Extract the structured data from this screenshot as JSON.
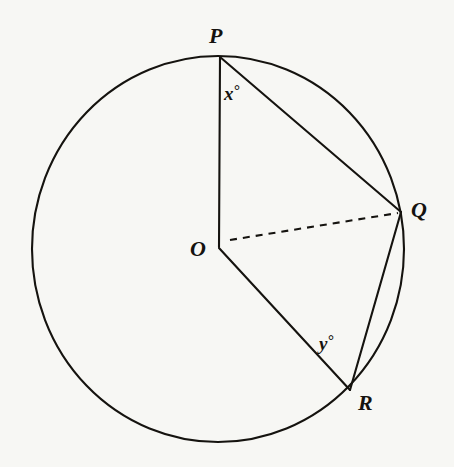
{
  "figure": {
    "kind": "circle-geometry-diagram",
    "background_color": "#f7f7f4",
    "stroke_color": "#15130f",
    "circle": {
      "center_label": "O",
      "center_x": 218,
      "center_y": 249,
      "radius_x": 186,
      "radius_y": 193,
      "stroke_width": 2.0
    },
    "points": [
      {
        "id": "P",
        "label": "P",
        "x": 220,
        "y": 57,
        "on_circle": true
      },
      {
        "id": "Q",
        "label": "Q",
        "x": 401,
        "y": 212,
        "on_circle": true
      },
      {
        "id": "R",
        "label": "R",
        "x": 350,
        "y": 390,
        "on_circle": true
      },
      {
        "id": "O",
        "label": "O",
        "x": 218,
        "y": 246,
        "on_circle": false
      }
    ],
    "segments": [
      {
        "id": "OP",
        "from": "O",
        "to": "P",
        "style": "solid",
        "x1": 218,
        "y1": 246,
        "x2": 220,
        "y2": 57
      },
      {
        "id": "OR",
        "from": "O",
        "to": "R",
        "style": "solid",
        "x1": 218,
        "y1": 246,
        "x2": 350,
        "y2": 390
      },
      {
        "id": "OQ",
        "from": "O",
        "to": "Q",
        "style": "dashed",
        "x1": 228,
        "y1": 240,
        "x2": 399,
        "y2": 213
      },
      {
        "id": "PQ",
        "from": "P",
        "to": "Q",
        "style": "solid",
        "x1": 220,
        "y1": 57,
        "x2": 401,
        "y2": 212
      },
      {
        "id": "QR",
        "from": "Q",
        "to": "R",
        "style": "solid",
        "x1": 401,
        "y1": 212,
        "x2": 350,
        "y2": 390
      }
    ],
    "angle_labels": [
      {
        "id": "x",
        "variable": "x",
        "degree_symbol": "°",
        "at_vertex": "P",
        "x": 237,
        "y": 94
      },
      {
        "id": "y",
        "variable": "y",
        "degree_symbol": "°",
        "at_vertex": "R",
        "x": 337,
        "y": 345
      }
    ]
  }
}
